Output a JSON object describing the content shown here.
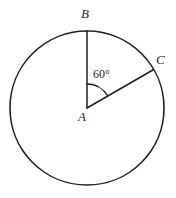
{
  "figure": {
    "background_color": "#ffffff",
    "stroke_color": "#231f20",
    "text_color": "#231f20",
    "circle": {
      "center_x": 87,
      "center_y": 108,
      "radius": 77,
      "stroke_width": 1.6
    },
    "radii": [
      {
        "name": "AB",
        "from": "A",
        "to": "B",
        "angle_from_vertical_deg": 0,
        "end_x": 87,
        "end_y": 31
      },
      {
        "name": "AC",
        "from": "A",
        "to": "C",
        "angle_from_vertical_deg": 60,
        "end_x": 153.7,
        "end_y": 69.5
      }
    ],
    "angle_arc": {
      "radius": 24,
      "start_angle_from_vertical_deg": 0,
      "end_angle_from_vertical_deg": 60
    },
    "labels": {
      "point_b": "B",
      "point_c": "C",
      "point_a": "A",
      "angle_value": "60°"
    }
  }
}
